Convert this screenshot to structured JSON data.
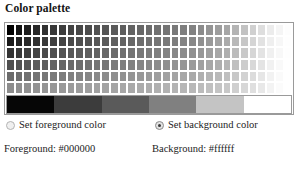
{
  "page_title": "Color palette",
  "palette": {
    "grid": {
      "rows": 6,
      "columns": 33,
      "row_colors": [
        [
          "#000000",
          "#141414",
          "#1e1e1e",
          "#282828",
          "#303030",
          "#383838",
          "#3d3d3d",
          "#434343",
          "#474747",
          "#4c4c4c",
          "#515151",
          "#555555",
          "#5a5a5a",
          "#5e5e5e",
          "#636363",
          "#676767",
          "#6c6c6c",
          "#707070",
          "#757575",
          "#797979",
          "#7e7e7e",
          "#828282",
          "#8b8b8b",
          "#949494",
          "#9d9d9d",
          "#a6a6a6",
          "#b4b4b4",
          "#c2c2c2",
          "#d0d0d0",
          "#dedede",
          "#ececec",
          "#f5f5f5",
          "#fdfdfd"
        ],
        [
          "#1a1a1a",
          "#222222",
          "#2a2a2a",
          "#323232",
          "#393939",
          "#3f3f3f",
          "#444444",
          "#494949",
          "#4e4e4e",
          "#525252",
          "#575757",
          "#5b5b5b",
          "#606060",
          "#646464",
          "#686868",
          "#6d6d6d",
          "#717171",
          "#757575",
          "#7a7a7a",
          "#7e7e7e",
          "#838383",
          "#888888",
          "#909090",
          "#999999",
          "#a2a2a2",
          "#ababab",
          "#b9b9b9",
          "#c7c7c7",
          "#d5d5d5",
          "#e2e2e2",
          "#efefef",
          "#f7f7f7",
          "#fefefe"
        ],
        [
          "#343434",
          "#3a3a3a",
          "#404040",
          "#464646",
          "#4b4b4b",
          "#505050",
          "#545454",
          "#585858",
          "#5c5c5c",
          "#606060",
          "#646464",
          "#686868",
          "#6c6c6c",
          "#707070",
          "#747474",
          "#787878",
          "#7c7c7c",
          "#808080",
          "#848484",
          "#888888",
          "#8c8c8c",
          "#909090",
          "#979797",
          "#9f9f9f",
          "#a7a7a7",
          "#afafaf",
          "#bcbcbc",
          "#c9c9c9",
          "#d6d6d6",
          "#e3e3e3",
          "#f0f0f0",
          "#f8f8f8",
          "#fefefe"
        ],
        [
          "#4e4e4e",
          "#525252",
          "#575757",
          "#5b5b5b",
          "#5f5f5f",
          "#636363",
          "#666666",
          "#6a6a6a",
          "#6d6d6d",
          "#717171",
          "#747474",
          "#777777",
          "#7b7b7b",
          "#7e7e7e",
          "#818181",
          "#858585",
          "#888888",
          "#8c8c8c",
          "#8f8f8f",
          "#939393",
          "#969696",
          "#9a9a9a",
          "#a0a0a0",
          "#a7a7a7",
          "#aeaeae",
          "#b5b5b5",
          "#c0c0c0",
          "#cccccc",
          "#d8d8d8",
          "#e4e4e4",
          "#f1f1f1",
          "#f9f9f9",
          "#ffffff"
        ],
        [
          "#6b6b6b",
          "#6e6e6e",
          "#717171",
          "#747474",
          "#777777",
          "#7a7a7a",
          "#7d7d7d",
          "#808080",
          "#838383",
          "#868686",
          "#898989",
          "#8c8c8c",
          "#8f8f8f",
          "#929292",
          "#959595",
          "#989898",
          "#9b9b9b",
          "#9e9e9e",
          "#a1a1a1",
          "#a4a4a4",
          "#a7a7a7",
          "#aaaaaa",
          "#afafaf",
          "#b4b4b4",
          "#b9b9b9",
          "#bfbfbf",
          "#c8c8c8",
          "#d2d2d2",
          "#dcdcdc",
          "#e6e6e6",
          "#f2f2f2",
          "#fafafa",
          "#ffffff"
        ],
        [
          "#8d8d8d",
          "#8f8f8f",
          "#919191",
          "#939393",
          "#959595",
          "#979797",
          "#999999",
          "#9b9b9b",
          "#9d9d9d",
          "#9f9f9f",
          "#a1a1a1",
          "#a3a3a3",
          "#a5a5a5",
          "#a7a7a7",
          "#a9a9a9",
          "#ababab",
          "#adadad",
          "#b0b0b0",
          "#b2b2b2",
          "#b4b4b4",
          "#b6b6b6",
          "#b8b8b8",
          "#bcbcbc",
          "#c0c0c0",
          "#c4c4c4",
          "#c8c8c8",
          "#cfcfcf",
          "#d7d7d7",
          "#dfdfdf",
          "#e8e8e8",
          "#f3f3f3",
          "#fbfbfb",
          "#ffffff"
        ]
      ]
    },
    "gradient_bands": [
      "#060606",
      "#3c3c3c",
      "#5a5a5a",
      "#808080",
      "#c4c4c4",
      "#ffffff"
    ]
  },
  "options": {
    "foreground": {
      "label": "Set foreground color",
      "selected": false
    },
    "background": {
      "label": "Set background color",
      "selected": true
    }
  },
  "values": {
    "foreground": "Foreground: #000000",
    "background": "Background: #ffffff"
  }
}
